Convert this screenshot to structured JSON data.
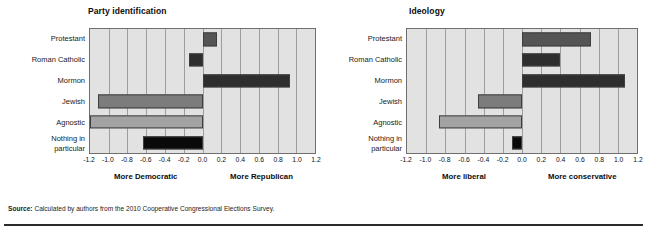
{
  "source": {
    "label": "Source:",
    "text": " Calculated by authors from the 2010 Cooperative Congressional Elections Survey."
  },
  "colors": {
    "plot_background": "#e2e2e2",
    "gridline": "#9d9d9d",
    "bar_outline": "#3d3d3d",
    "dark_gray": "#545454",
    "near_black": "#2e2e2e",
    "medium_gray": "#7c7c7c",
    "light_gray": "#a3a3a3",
    "black": "#0a0a0a"
  },
  "chart_data": [
    {
      "type": "bar",
      "orientation": "horizontal",
      "title": "Party identification",
      "xlabel": "",
      "ylabel": "",
      "xlim": [
        -1.2,
        1.2
      ],
      "grid": true,
      "legend": "none",
      "left_caption": "More Democratic",
      "right_caption": "More Republican",
      "tick_labels": [
        "-1.2",
        "-1.0",
        "-0.8",
        "-0.6",
        "-0.4",
        "-0.2",
        "0.0",
        "0.2",
        "0.4",
        "0.6",
        "0.8",
        "1.0",
        "1.2"
      ],
      "tick_values": [
        -1.2,
        -1.0,
        -0.8,
        -0.6,
        -0.4,
        -0.2,
        0.0,
        0.2,
        0.4,
        0.6,
        0.8,
        1.0,
        1.2
      ],
      "categories": [
        "Protestant",
        "Roman Catholic",
        "Mormon",
        "Jewish",
        "Agnostic",
        "Nothing in\nparticular"
      ],
      "values": [
        0.15,
        -0.14,
        0.93,
        -1.12,
        -1.2,
        -0.64
      ],
      "bar_colors": [
        "#545454",
        "#2e2e2e",
        "#2e2e2e",
        "#7c7c7c",
        "#a3a3a3",
        "#0a0a0a"
      ]
    },
    {
      "type": "bar",
      "orientation": "horizontal",
      "title": "Ideology",
      "xlabel": "",
      "ylabel": "",
      "xlim": [
        -1.2,
        1.2
      ],
      "grid": true,
      "legend": "none",
      "left_caption": "More liberal",
      "right_caption": "More  conservative",
      "tick_labels": [
        "-1.2",
        "-1.0",
        "-0.8",
        "-0.6",
        "-0.4",
        "-0.2",
        "0.0",
        "0.2",
        "0.4",
        "0.6",
        "0.8",
        "1.0",
        "1.2"
      ],
      "tick_values": [
        -1.2,
        -1.0,
        -0.8,
        -0.6,
        -0.4,
        -0.2,
        0.0,
        0.2,
        0.4,
        0.6,
        0.8,
        1.0,
        1.2
      ],
      "categories": [
        "Protestant",
        "Roman Catholic",
        "Mormon",
        "Jewish",
        "Agnostic",
        "Nothing in\nparticular"
      ],
      "values": [
        0.72,
        0.4,
        1.07,
        -0.46,
        -0.87,
        -0.1
      ],
      "bar_colors": [
        "#545454",
        "#2e2e2e",
        "#2e2e2e",
        "#7c7c7c",
        "#a3a3a3",
        "#0a0a0a"
      ]
    }
  ]
}
